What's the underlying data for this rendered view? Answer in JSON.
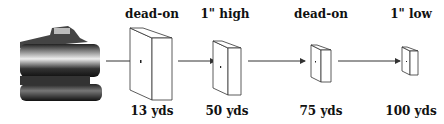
{
  "diagram": {
    "source": "rifle-barrel",
    "targets": [
      {
        "top_label": "dead-on",
        "bottom_label": "13 yds"
      },
      {
        "top_label": "1\" high",
        "bottom_label": "50 yds"
      },
      {
        "top_label": "dead-on",
        "bottom_label": "75 yds"
      },
      {
        "top_label": "1\" low",
        "bottom_label": "100 yds"
      }
    ]
  }
}
